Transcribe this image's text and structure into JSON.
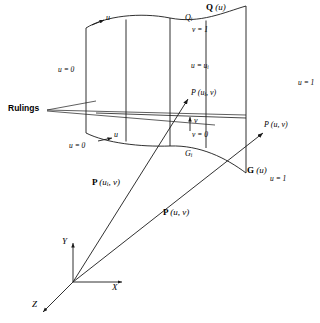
{
  "figure": {
    "type": "ruled-lofted-surface-diagram",
    "stroke_color": "#1a1a1a",
    "background": "#ffffff"
  },
  "labels": {
    "rulings": "Rulings",
    "u_top_arrow": "u",
    "u_bottom_arrow": "u",
    "u_zero_left": "u = 0",
    "u_zero_bottom": "u = 0",
    "Q_curve": "Q",
    "Q_curve_arg": "(u)",
    "Q_i": "Q",
    "Q_i_sub": "i",
    "v_equals_1": "v = 1",
    "u_equals_ui": "u = u",
    "u_equals_ui_sub": "i",
    "P_ui_v_point": "P",
    "P_ui_v_point_arg": "(u",
    "P_ui_v_point_sub": "i",
    "P_ui_v_point_arg2": ", v)",
    "v_axis_arrow": "v",
    "v_equals_0": "v = 0",
    "G_i": "G",
    "G_i_sub": "i",
    "P_u_v_point": "P (u, v)",
    "u_equals_1_right": "u = 1",
    "G_curve": "G",
    "G_curve_arg": "(u)",
    "u_equals_1_bottom": "u = 1",
    "vector_P_ui_v": "P",
    "vector_P_ui_v_arg": "(u",
    "vector_P_ui_v_sub": "i",
    "vector_P_ui_v_arg2": ", v)",
    "vector_P_u_v": "P",
    "vector_P_u_v_arg": "(u, v)",
    "axis_x": "X",
    "axis_y": "Y",
    "axis_z": "Z"
  }
}
